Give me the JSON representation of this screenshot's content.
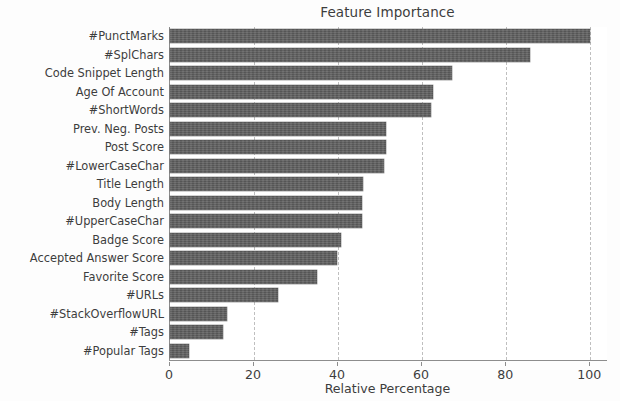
{
  "chart_data": {
    "type": "bar",
    "orientation": "horizontal",
    "title": "Feature Importance",
    "xlabel": "Relative Percentage",
    "ylabel": "",
    "xlim": [
      0,
      104
    ],
    "xticks": [
      0,
      20,
      40,
      60,
      80,
      100
    ],
    "xtick_labels": [
      "0",
      "20",
      "40",
      "60",
      "80",
      "100"
    ],
    "grid": "vertical-dashed",
    "legend": "none",
    "bar_color": "#5e5e5e",
    "categories": [
      "#PunctMarks",
      "#SplChars",
      "Code Snippet Length",
      "Age Of Account",
      "#ShortWords",
      "Prev. Neg. Posts",
      "Post Score",
      "#LowerCaseChar",
      "Title Length",
      "Body Length",
      "#UpperCaseChar",
      "Badge Score",
      "Accepted Answer Score",
      "Favorite Score",
      "#URLs",
      "#StackOverflowURL",
      "#Tags",
      "#Popular Tags"
    ],
    "values": [
      100.0,
      85.6,
      67.1,
      62.7,
      62.0,
      51.5,
      51.3,
      51.0,
      46.0,
      45.8,
      45.6,
      40.7,
      39.8,
      35.0,
      25.8,
      13.5,
      12.5,
      4.5
    ]
  }
}
